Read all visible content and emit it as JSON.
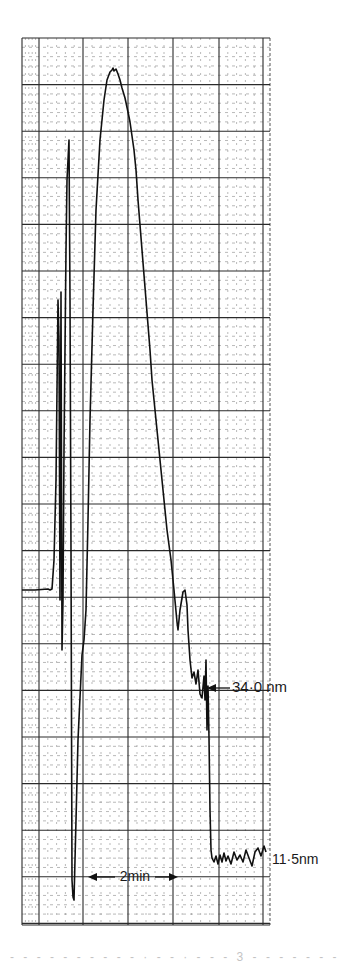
{
  "chart_data": {
    "type": "line",
    "title": "",
    "xlabel": "",
    "ylabel": "",
    "colors": {
      "paper": "#ffffff",
      "grid_major": "#2a2a2a",
      "grid_minor": "#8a8a8a",
      "trace": "#111111",
      "text": "#1a1a1a"
    },
    "grid": {
      "on": true,
      "left": 22,
      "right": 270,
      "top": 38,
      "bottom": 925,
      "major_x": [
        22,
        39,
        83,
        128,
        173,
        219,
        263
      ],
      "major_y_step": 46.6,
      "minor_divisions": 5
    },
    "time_scale": {
      "label": "2min",
      "x_start": 88,
      "x_end": 178,
      "y": 877,
      "minutes": 2
    },
    "annotations": [
      {
        "id": "level-34",
        "text": "34·0 nm",
        "x": 232,
        "y": 688,
        "arrow_to_x": 207,
        "arrow_to_y": 688
      },
      {
        "id": "level-11-5",
        "text": "11·5nm",
        "x": 272,
        "y": 860
      }
    ],
    "trace_points": [
      [
        22,
        590
      ],
      [
        35,
        590
      ],
      [
        48,
        589
      ],
      [
        50,
        590
      ],
      [
        52,
        589
      ],
      [
        54,
        560
      ],
      [
        56,
        480
      ],
      [
        58,
        300
      ],
      [
        59,
        340
      ],
      [
        60,
        600
      ],
      [
        61,
        292
      ],
      [
        62,
        650
      ],
      [
        63,
        600
      ],
      [
        64,
        450
      ],
      [
        66,
        250
      ],
      [
        67,
        180
      ],
      [
        68,
        160
      ],
      [
        69,
        140
      ],
      [
        70,
        300
      ],
      [
        71,
        550
      ],
      [
        72,
        880
      ],
      [
        73,
        897
      ],
      [
        74,
        900
      ],
      [
        75,
        860
      ],
      [
        78,
        740
      ],
      [
        82,
        655
      ],
      [
        84,
        640
      ],
      [
        86,
        610
      ],
      [
        88,
        520
      ],
      [
        90,
        420
      ],
      [
        93,
        310
      ],
      [
        96,
        210
      ],
      [
        100,
        140
      ],
      [
        104,
        100
      ],
      [
        107,
        80
      ],
      [
        110,
        72
      ],
      [
        112,
        70
      ],
      [
        113,
        68
      ],
      [
        114,
        71
      ],
      [
        116,
        69
      ],
      [
        118,
        74
      ],
      [
        120,
        80
      ],
      [
        122,
        88
      ],
      [
        125,
        98
      ],
      [
        128,
        112
      ],
      [
        130,
        122
      ],
      [
        132,
        136
      ],
      [
        134,
        150
      ],
      [
        136,
        170
      ],
      [
        138,
        200
      ],
      [
        140,
        225
      ],
      [
        142,
        250
      ],
      [
        144,
        275
      ],
      [
        146,
        300
      ],
      [
        148,
        325
      ],
      [
        150,
        350
      ],
      [
        152,
        380
      ],
      [
        155,
        410
      ],
      [
        158,
        440
      ],
      [
        161,
        470
      ],
      [
        164,
        500
      ],
      [
        167,
        530
      ],
      [
        171,
        560
      ],
      [
        174,
        590
      ],
      [
        177,
        622
      ],
      [
        178,
        630
      ],
      [
        180,
        610
      ],
      [
        183,
        592
      ],
      [
        185,
        590
      ],
      [
        187,
        605
      ],
      [
        188,
        630
      ],
      [
        190,
        660
      ],
      [
        192,
        678
      ],
      [
        194,
        672
      ],
      [
        196,
        684
      ],
      [
        198,
        670
      ],
      [
        200,
        694
      ],
      [
        202,
        698
      ],
      [
        204,
        676
      ],
      [
        205,
        700
      ],
      [
        206,
        660
      ],
      [
        207,
        730
      ],
      [
        208,
        686
      ],
      [
        209,
        738
      ],
      [
        210,
        810
      ],
      [
        211,
        850
      ],
      [
        212,
        858
      ],
      [
        214,
        862
      ],
      [
        216,
        856
      ],
      [
        218,
        864
      ],
      [
        220,
        855
      ],
      [
        222,
        862
      ],
      [
        224,
        853
      ],
      [
        226,
        861
      ],
      [
        228,
        856
      ],
      [
        231,
        864
      ],
      [
        234,
        852
      ],
      [
        237,
        860
      ],
      [
        240,
        855
      ],
      [
        243,
        862
      ],
      [
        246,
        850
      ],
      [
        249,
        858
      ],
      [
        252,
        866
      ],
      [
        255,
        852
      ],
      [
        258,
        848
      ],
      [
        261,
        856
      ],
      [
        264,
        846
      ],
      [
        266,
        852
      ]
    ]
  },
  "caption": {
    "text": "- - -   - - -   - - - - ·  - -  ·  - - - 3  - - -   - - - -"
  }
}
